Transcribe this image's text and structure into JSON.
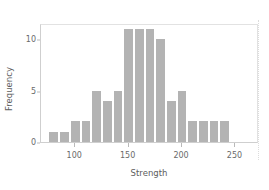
{
  "chart_data": {
    "type": "bar",
    "title": "",
    "subtitle": "",
    "xlabel": "Strength",
    "ylabel": "Frequency",
    "xlim": [
      68,
      272
    ],
    "ylim": [
      0,
      11.6
    ],
    "xticks": [
      100,
      150,
      200,
      250
    ],
    "xtick_labels": [
      "100",
      "150",
      "200",
      "250"
    ],
    "yticks": [
      0,
      5,
      10
    ],
    "ytick_labels": [
      "0",
      "5",
      "10"
    ],
    "grid": false,
    "legend": null,
    "bar_color": "#b3b3b3",
    "bin_width": 10,
    "bin_edges": [
      75,
      85,
      95,
      105,
      115,
      125,
      135,
      145,
      155,
      165,
      175,
      185,
      195,
      205,
      215,
      225,
      235,
      245
    ],
    "bin_centers": [
      80,
      90,
      100,
      110,
      120,
      130,
      140,
      150,
      160,
      170,
      180,
      190,
      200,
      210,
      220,
      230,
      240
    ],
    "values": [
      1,
      1,
      2,
      2,
      5,
      4,
      5,
      11,
      11,
      11,
      10,
      4,
      5,
      2,
      2,
      2,
      2
    ],
    "categories": [
      "75-85",
      "85-95",
      "95-105",
      "105-115",
      "115-125",
      "125-135",
      "135-145",
      "145-155",
      "155-165",
      "165-175",
      "175-185",
      "185-195",
      "195-205",
      "205-215",
      "215-225",
      "225-235",
      "235-245"
    ]
  }
}
